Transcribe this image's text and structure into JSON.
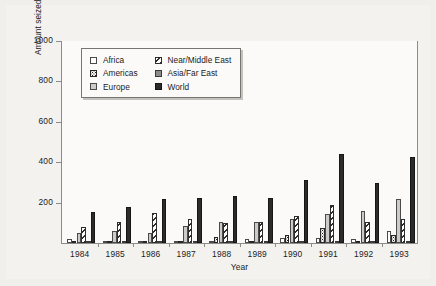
{
  "chart_data": {
    "type": "bar",
    "title": "",
    "xlabel": "Year",
    "ylabel": "Amount seized (tonnes)",
    "categories": [
      "1984",
      "1985",
      "1986",
      "1987",
      "1988",
      "1989",
      "1990",
      "1991",
      "1992",
      "1993"
    ],
    "ylim": [
      0,
      1000
    ],
    "yticks": [
      0,
      200,
      400,
      600,
      800,
      1000
    ],
    "ytick_labels": [
      "",
      "200",
      "400",
      "600",
      "800",
      "1000"
    ],
    "grid": false,
    "legend_position": "upper-left-inside",
    "series": [
      {
        "name": "Africa",
        "pattern": "empty",
        "color": "#ffffff",
        "values": [
          22,
          10,
          8,
          10,
          11,
          18,
          27,
          27,
          18,
          60
        ]
      },
      {
        "name": "Americas",
        "pattern": "dotted",
        "color": "#f6f5f3",
        "values": [
          6,
          7,
          9,
          6,
          28,
          5,
          42,
          75,
          6,
          40
        ]
      },
      {
        "name": "Europe",
        "pattern": "solid-light",
        "color": "#cdcbc8",
        "values": [
          52,
          58,
          52,
          82,
          103,
          103,
          120,
          142,
          158,
          218
        ]
      },
      {
        "name": "Near/Middle East",
        "pattern": "hatched",
        "color": "#ffffff",
        "values": [
          80,
          104,
          148,
          120,
          98,
          103,
          135,
          190,
          103,
          120
        ]
      },
      {
        "name": "Asia/Far East",
        "pattern": "solid-mid",
        "color": "#8d8b88",
        "values": [
          6,
          6,
          9,
          9,
          11,
          6,
          6,
          6,
          6,
          6
        ]
      },
      {
        "name": "World",
        "pattern": "solid-dark",
        "color": "#2b2b2b",
        "values": [
          152,
          178,
          218,
          224,
          235,
          222,
          312,
          440,
          296,
          425
        ]
      }
    ]
  },
  "axes": {
    "y_label": "Amount seized (tonnes)",
    "x_label": "Year",
    "y_ticks": [
      "1000",
      "800",
      "600",
      "400",
      "200"
    ]
  },
  "legend": {
    "items": [
      {
        "label": "Africa"
      },
      {
        "label": "Near/Middle East"
      },
      {
        "label": "Americas"
      },
      {
        "label": "Asia/Far East"
      },
      {
        "label": "Europe"
      },
      {
        "label": "World"
      }
    ]
  },
  "years": [
    "1984",
    "1985",
    "1986",
    "1987",
    "1988",
    "1989",
    "1990",
    "1991",
    "1992",
    "1993"
  ]
}
